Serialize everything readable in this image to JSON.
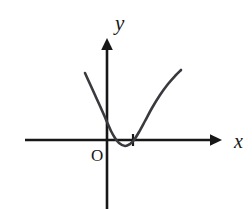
{
  "figure": {
    "background_color": "#ffffff",
    "width": 252,
    "height": 209,
    "axis_color": "#171717",
    "curve_color": "#3a3a3e",
    "label_color": "#171717"
  },
  "labels": {
    "y_axis": "y",
    "x_axis": "x",
    "origin": "O"
  },
  "chart_data": {
    "type": "line",
    "title": "",
    "xlabel": "x",
    "ylabel": "y",
    "subtitle": "",
    "grid": false,
    "legend": "none",
    "annotations": [
      "O"
    ],
    "origin_px": {
      "x": 107,
      "y": 140
    },
    "axes": {
      "x_axis": {
        "label": "x",
        "start_px": {
          "x": 25,
          "y": 140
        },
        "arrow_tip_px": {
          "x": 222,
          "y": 140
        },
        "label_px": {
          "x": 234,
          "y": 147
        },
        "arrow": true,
        "tick_marks": [
          {
            "label": "",
            "x_px": 133,
            "length_px": 12
          }
        ]
      },
      "y_axis": {
        "label": "y",
        "arrow_tip_px": {
          "x": 107,
          "y": 38
        },
        "end_px": {
          "x": 107,
          "y": 209
        },
        "label_px": {
          "x": 115,
          "y": 30
        },
        "arrow": true,
        "tick_marks": []
      }
    },
    "series": [
      {
        "name": "parabola",
        "shape": "upward-opening parabola",
        "color": "#3a3a3e",
        "stroke_width_px": 2.6,
        "vertex_px": {
          "x": 125,
          "y": 146
        },
        "x_intercepts_px": [
          115,
          134
        ],
        "y_intercept_px": {
          "x": 107,
          "y": 122
        },
        "left_end_px": {
          "x": 85,
          "y": 73
        },
        "right_end_px": {
          "x": 181,
          "y": 70
        },
        "points_px": [
          {
            "x": 85,
            "y": 73
          },
          {
            "x": 90,
            "y": 84
          },
          {
            "x": 95,
            "y": 95
          },
          {
            "x": 100,
            "y": 106
          },
          {
            "x": 104,
            "y": 115
          },
          {
            "x": 107,
            "y": 122
          },
          {
            "x": 111,
            "y": 131
          },
          {
            "x": 115,
            "y": 138
          },
          {
            "x": 119,
            "y": 143
          },
          {
            "x": 125,
            "y": 146
          },
          {
            "x": 130,
            "y": 144
          },
          {
            "x": 134,
            "y": 140
          },
          {
            "x": 139,
            "y": 132
          },
          {
            "x": 145,
            "y": 121
          },
          {
            "x": 152,
            "y": 108
          },
          {
            "x": 160,
            "y": 95
          },
          {
            "x": 168,
            "y": 84
          },
          {
            "x": 175,
            "y": 76
          },
          {
            "x": 181,
            "y": 70
          }
        ]
      }
    ]
  }
}
